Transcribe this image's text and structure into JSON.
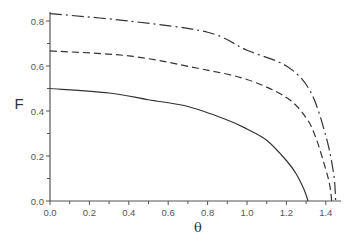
{
  "chart_data": {
    "type": "line",
    "title": "",
    "xlabel": "θ",
    "ylabel": "F",
    "xlim": [
      0.0,
      1.47
    ],
    "ylim": [
      0.0,
      0.84
    ],
    "grid": false,
    "legend": "none",
    "x_ticks": [
      "0.0",
      "0.2",
      "0.4",
      "0.6",
      "0.8",
      "1.0",
      "1.2",
      "1.4"
    ],
    "x_tick_values": [
      0.0,
      0.2,
      0.4,
      0.6,
      0.8,
      1.0,
      1.2,
      1.4
    ],
    "x_minor_step": 0.1,
    "y_ticks": [
      "0.0",
      "0.2",
      "0.4",
      "0.6",
      "0.8"
    ],
    "y_tick_values": [
      0.0,
      0.2,
      0.4,
      0.6,
      0.8
    ],
    "y_minor_step": 0.1,
    "series": [
      {
        "name": "solid",
        "style": "solid",
        "x": [
          0.0,
          0.3,
          0.5,
          0.7,
          0.9,
          1.0,
          1.1,
          1.2,
          1.25,
          1.29,
          1.31
        ],
        "y": [
          0.5,
          0.48,
          0.45,
          0.42,
          0.36,
          0.32,
          0.27,
          0.18,
          0.12,
          0.05,
          0.0
        ]
      },
      {
        "name": "dashed",
        "style": "dashed",
        "x": [
          0.0,
          0.4,
          0.75,
          1.0,
          1.2,
          1.3,
          1.35,
          1.4,
          1.42,
          1.43
        ],
        "y": [
          0.667,
          0.645,
          0.59,
          0.54,
          0.46,
          0.37,
          0.28,
          0.14,
          0.07,
          0.0
        ]
      },
      {
        "name": "dash-dot",
        "style": "dashdot",
        "x": [
          0.0,
          0.4,
          0.8,
          1.0,
          1.2,
          1.32,
          1.4,
          1.44,
          1.45
        ],
        "y": [
          0.833,
          0.8,
          0.75,
          0.67,
          0.6,
          0.49,
          0.29,
          0.12,
          0.0
        ]
      }
    ]
  }
}
